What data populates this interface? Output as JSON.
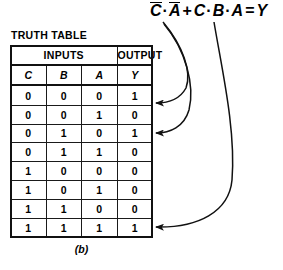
{
  "figure": {
    "caption": "(b)",
    "table_label": "TRUTH TABLE"
  },
  "equation": {
    "full_text": "C̄·Ā + C·B·A = Y",
    "term1_var1": "C",
    "term1_op": "·",
    "term1_var2": "A",
    "plus": "+",
    "term2_var1": "C",
    "term2_op1": "·",
    "term2_var2": "B",
    "term2_op2": "·",
    "term2_var3": "A",
    "equals": "=",
    "result": "Y"
  },
  "table": {
    "group_headers": [
      {
        "label": "INPUTS",
        "span": 3
      },
      {
        "label": "OUTPUT",
        "span": 1
      }
    ],
    "column_headers": [
      "C",
      "B",
      "A",
      "Y"
    ],
    "rows": [
      {
        "C": "0",
        "B": "0",
        "A": "0",
        "Y": "1"
      },
      {
        "C": "0",
        "B": "0",
        "A": "1",
        "Y": "0"
      },
      {
        "C": "0",
        "B": "1",
        "A": "0",
        "Y": "1"
      },
      {
        "C": "0",
        "B": "1",
        "A": "1",
        "Y": "0"
      },
      {
        "C": "1",
        "B": "0",
        "A": "0",
        "Y": "0"
      },
      {
        "C": "1",
        "B": "0",
        "A": "1",
        "Y": "0"
      },
      {
        "C": "1",
        "B": "1",
        "A": "0",
        "Y": "0"
      },
      {
        "C": "1",
        "B": "1",
        "A": "1",
        "Y": "1"
      }
    ]
  },
  "annotations": {
    "arrows": [
      {
        "name": "arrow-term1-to-row1",
        "from_term": "C̄·Ā",
        "to_row": 1
      },
      {
        "name": "arrow-term1-to-row3",
        "from_term": "C̄·Ā",
        "to_row": 3
      },
      {
        "name": "arrow-term2-to-row8",
        "from_term": "C·B·A",
        "to_row": 8
      }
    ]
  },
  "colors": {
    "ink": "#000000",
    "background": "#ffffff"
  }
}
